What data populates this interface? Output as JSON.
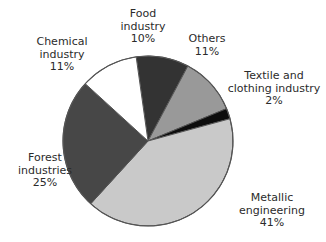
{
  "chart_data": {
    "type": "pie",
    "title": "",
    "subtitle": "",
    "xlabel": "",
    "ylabel": "",
    "legend_position": "none",
    "grid": false,
    "unit": "%",
    "categories": [
      "Food industry",
      "Others",
      "Textile and clothing industry",
      "Metallic engineering",
      "Forest industries",
      "Chemical industry"
    ],
    "values": [
      10,
      11,
      2,
      41,
      25,
      11
    ],
    "slices": [
      {
        "name": "Food industry",
        "label_line1": "Food",
        "label_line2": "industry",
        "value": 10,
        "value_label": "10%",
        "color": "#333333"
      },
      {
        "name": "Others",
        "label_line1": "Others",
        "label_line2": "",
        "value": 11,
        "value_label": "11%",
        "color": "#999999"
      },
      {
        "name": "Textile and clothing industry",
        "label_line1": "Textile and",
        "label_line2": "clothing industry",
        "value": 2,
        "value_label": "2%",
        "color": "#0d0d0d"
      },
      {
        "name": "Metallic engineering",
        "label_line1": "Metallic",
        "label_line2": "engineering",
        "value": 41,
        "value_label": "41%",
        "color": "#c9c9c9"
      },
      {
        "name": "Forest industries",
        "label_line1": "Forest",
        "label_line2": "industries",
        "value": 25,
        "value_label": "25%",
        "color": "#474747"
      },
      {
        "name": "Chemical industry",
        "label_line1": "Chemical",
        "label_line2": "industry",
        "value": 11,
        "value_label": "11%",
        "color": "#ffffff"
      }
    ],
    "start_angle_deg": -8,
    "direction": "clockwise",
    "outline_color": "#555555",
    "background": "#ffffff"
  }
}
